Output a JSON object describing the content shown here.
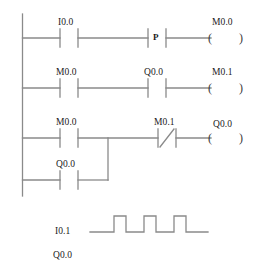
{
  "diagram": {
    "kind": "ladder-logic",
    "colors": {
      "line": "#8a8a8a",
      "text": "#1b1b1b",
      "background": "#ffffff"
    },
    "rungs": [
      {
        "id": "rung-1",
        "contacts": [
          {
            "label": "I0.0",
            "type": "normally-open"
          },
          {
            "label": "P",
            "type": "positive-edge"
          }
        ],
        "coil": {
          "label": "M0.0",
          "type": "output-coil"
        }
      },
      {
        "id": "rung-2",
        "contacts": [
          {
            "label": "M0.0",
            "type": "normally-open"
          },
          {
            "label": "Q0.0",
            "type": "normally-open"
          }
        ],
        "coil": {
          "label": "M0.1",
          "type": "output-coil"
        }
      },
      {
        "id": "rung-3",
        "contacts": [
          {
            "label": "M0.0",
            "type": "normally-open"
          },
          {
            "label": "M0.1",
            "type": "normally-closed"
          }
        ],
        "coil": {
          "label": "Q0.0",
          "type": "output-coil"
        }
      },
      {
        "id": "rung-4-branch",
        "contacts": [
          {
            "label": "Q0.0",
            "type": "normally-open"
          }
        ],
        "coil": null
      }
    ]
  },
  "timing": {
    "signals": [
      {
        "label": "I0.1",
        "has_waveform": true,
        "pulses": 3,
        "initial_state": "low",
        "final_state": "low"
      },
      {
        "label": "Q0.0",
        "has_waveform": false
      }
    ]
  },
  "labels": {
    "r1_c1": "I0.0",
    "r1_c2": "P",
    "r1_coil": "M0.0",
    "r2_c1": "M0.0",
    "r2_c2": "Q0.0",
    "r2_coil": "M0.1",
    "r3_c1": "M0.0",
    "r3_c2": "M0.1",
    "r3_coil": "Q0.0",
    "r4_c1": "Q0.0",
    "t1": "I0.1",
    "t2": "Q0.0",
    "paren_open": "(",
    "paren_close": ")"
  }
}
